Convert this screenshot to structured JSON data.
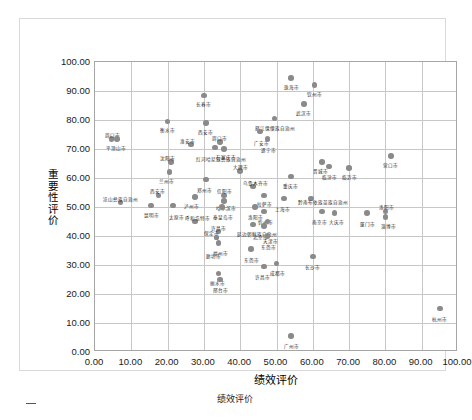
{
  "chart_data": {
    "type": "scatter",
    "title": "",
    "xlabel": "绩效评价",
    "ylabel": "重要性评价",
    "xlim": [
      0,
      100
    ],
    "ylim": [
      0,
      100
    ],
    "xticks": [
      "0.00",
      "10.00",
      "20.00",
      "30.00",
      "40.00",
      "50.00",
      "60.00",
      "70.00",
      "80.00",
      "90.00",
      "100.00"
    ],
    "yticks": [
      "0.00",
      "10.00",
      "20.00",
      "30.00",
      "40.00",
      "50.00",
      "60.00",
      "70.00",
      "80.00",
      "90.00",
      "100.00"
    ],
    "grid": true,
    "legend": "none",
    "marker_color": "#8a8a8a",
    "points": [
      {
        "label": "珠海市",
        "x": 54.0,
        "y": 94.5,
        "lx": 0,
        "ly": 7
      },
      {
        "label": "钦州市",
        "x": 60.5,
        "y": 92.0,
        "lx": 0,
        "ly": 7
      },
      {
        "label": "长春市",
        "x": 30.0,
        "y": 88.5,
        "lx": 0,
        "ly": 7
      },
      {
        "label": "武汉市",
        "x": 57.5,
        "y": 85.5,
        "lx": 0,
        "ly": 7
      },
      {
        "label": "衡水市",
        "x": 20.0,
        "y": 79.5,
        "lx": 0,
        "ly": 7
      },
      {
        "label": "西安市",
        "x": 30.5,
        "y": 79.0,
        "lx": 0,
        "ly": 7
      },
      {
        "label": "怒江傈僳族自治州",
        "x": 49.5,
        "y": 80.5,
        "lx": 0,
        "ly": 7
      },
      {
        "label": "周口市",
        "x": 4.5,
        "y": 73.5,
        "lx": 1,
        "ly": -6
      },
      {
        "label": "平顶山市",
        "x": 6.0,
        "y": 73.5,
        "lx": -1,
        "ly": 7
      },
      {
        "label": "淮安市",
        "x": 26.5,
        "y": 71.5,
        "lx": -4,
        "ly": -6
      },
      {
        "label": "周口市",
        "x": 34.5,
        "y": 72.5,
        "lx": -1,
        "ly": -6
      },
      {
        "label": "石家庄市",
        "x": 35.5,
        "y": 70.0,
        "lx": 2,
        "ly": 6
      },
      {
        "label": "广安市",
        "x": 45.5,
        "y": 76.0,
        "lx": 1,
        "ly": 9
      },
      {
        "label": "遂宁市",
        "x": 47.5,
        "y": 73.5,
        "lx": 1,
        "ly": 9
      },
      {
        "label": "红河哈尼族彝族自治州",
        "x": 33.0,
        "y": 70.5,
        "lx": 6,
        "ly": 9
      },
      {
        "label": "沈阳市",
        "x": 21.0,
        "y": 65.5,
        "lx": -4,
        "ly": -6
      },
      {
        "label": "兰州市",
        "x": 20.5,
        "y": 62.0,
        "lx": -3,
        "ly": 7
      },
      {
        "label": "大理市",
        "x": 40.0,
        "y": 62.5,
        "lx": 0,
        "ly": -6
      },
      {
        "label": "营口市",
        "x": 81.5,
        "y": 67.5,
        "lx": 0,
        "ly": 7
      },
      {
        "label": "晋城市",
        "x": 62.5,
        "y": 65.5,
        "lx": -1,
        "ly": 7
      },
      {
        "label": "临汾市",
        "x": 64.5,
        "y": 64.0,
        "lx": 0,
        "ly": 9
      },
      {
        "label": "临沂市",
        "x": 70.0,
        "y": 63.5,
        "lx": 0,
        "ly": 7
      },
      {
        "label": "重庆市",
        "x": 54.0,
        "y": 60.5,
        "lx": -1,
        "ly": 7
      },
      {
        "label": "乌鲁木齐市",
        "x": 43.5,
        "y": 57.0,
        "lx": 3,
        "ly": -6
      },
      {
        "label": "郑州市",
        "x": 30.5,
        "y": 59.5,
        "lx": -1,
        "ly": 9
      },
      {
        "label": "西安市",
        "x": 17.5,
        "y": 54.0,
        "lx": -1,
        "ly": -6
      },
      {
        "label": "凉山彝族自治州",
        "x": 7.0,
        "y": 51.5,
        "lx": 0,
        "ly": -6
      },
      {
        "label": "泸州市",
        "x": 27.5,
        "y": 53.5,
        "lx": -3,
        "ly": 7
      },
      {
        "label": "信阳市",
        "x": 35.5,
        "y": 54.0,
        "lx": 1,
        "ly": -6
      },
      {
        "label": "哈尔滨市",
        "x": 35.5,
        "y": 52.0,
        "lx": 2,
        "ly": 5
      },
      {
        "label": "拉萨市",
        "x": 46.5,
        "y": 54.0,
        "lx": 1,
        "ly": 7
      },
      {
        "label": "上海市",
        "x": 52.0,
        "y": 53.0,
        "lx": -1,
        "ly": 9
      },
      {
        "label": "黔南布依族苗族自治州",
        "x": 59.5,
        "y": 53.0,
        "lx": 12,
        "ly": 2
      },
      {
        "label": "昆明市",
        "x": 15.5,
        "y": 50.5,
        "lx": 0,
        "ly": 7
      },
      {
        "label": "太原市",
        "x": 21.5,
        "y": 50.5,
        "lx": 3,
        "ly": 9
      },
      {
        "label": "秦皇岛市",
        "x": 35.0,
        "y": 50.0,
        "lx": 1,
        "ly": 8
      },
      {
        "label": "洛阳市",
        "x": 44.0,
        "y": 50.0,
        "lx": 1,
        "ly": 8
      },
      {
        "label": "忻州市",
        "x": 46.5,
        "y": 48.5,
        "lx": 2,
        "ly": 9
      },
      {
        "label": "呼和浩特市",
        "x": 27.5,
        "y": 45.0,
        "lx": 3,
        "ly": -6
      },
      {
        "label": "延边朝鲜族自治州",
        "x": 43.5,
        "y": 44.0,
        "lx": 4,
        "ly": 8
      },
      {
        "label": "许昌市",
        "x": 34.0,
        "y": 41.5,
        "lx": 0,
        "ly": -6
      },
      {
        "label": "保定市",
        "x": 33.5,
        "y": 39.5,
        "lx": -5,
        "ly": -6
      },
      {
        "label": "福州市",
        "x": 34.0,
        "y": 37.5,
        "lx": 2,
        "ly": 8
      },
      {
        "label": "北京市",
        "x": 46.5,
        "y": 43.5,
        "lx": -3,
        "ly": 9
      },
      {
        "label": "东莞市",
        "x": 47.5,
        "y": 40.0,
        "lx": 1,
        "ly": 9
      },
      {
        "label": "廊坊市",
        "x": 33.5,
        "y": 39.5,
        "lx": -3,
        "ly": 17
      },
      {
        "label": "天津市",
        "x": 47.5,
        "y": 45.0,
        "lx": 3,
        "ly": 17
      },
      {
        "label": "南京市",
        "x": 62.5,
        "y": 48.5,
        "lx": -2,
        "ly": 9
      },
      {
        "label": "大庆市",
        "x": 66.0,
        "y": 48.0,
        "lx": 2,
        "ly": 7
      },
      {
        "label": "厦门市",
        "x": 75.0,
        "y": 48.0,
        "lx": 0,
        "ly": 9
      },
      {
        "label": "洛阳市",
        "x": 80.0,
        "y": 48.5,
        "lx": 1,
        "ly": -6
      },
      {
        "label": "淄博市",
        "x": 80.0,
        "y": 46.5,
        "lx": 3,
        "ly": 7
      },
      {
        "label": "东莞市",
        "x": 43.0,
        "y": 35.5,
        "lx": 0,
        "ly": 9
      },
      {
        "label": "长沙市",
        "x": 60.0,
        "y": 33.0,
        "lx": 0,
        "ly": 9
      },
      {
        "label": "许昌市",
        "x": 46.5,
        "y": 29.5,
        "lx": -1,
        "ly": 9
      },
      {
        "label": "成都市",
        "x": 50.0,
        "y": 30.5,
        "lx": 1,
        "ly": 7
      },
      {
        "label": "丽水市",
        "x": 34.0,
        "y": 27.0,
        "lx": -1,
        "ly": 7
      },
      {
        "label": "邢台市",
        "x": 34.5,
        "y": 25.0,
        "lx": 0,
        "ly": 8
      },
      {
        "label": "杭州市",
        "x": 95.0,
        "y": 15.0,
        "lx": 0,
        "ly": 8
      },
      {
        "label": "广州市",
        "x": 54.0,
        "y": 5.5,
        "lx": 0,
        "ly": 8
      }
    ]
  },
  "caption": {
    "text": "绩效评价"
  }
}
